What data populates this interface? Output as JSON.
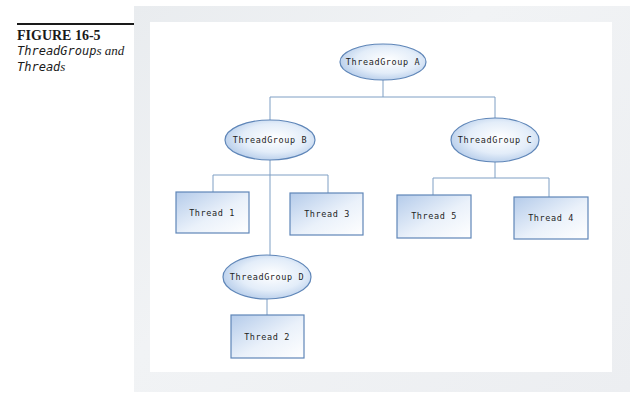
{
  "caption": {
    "figure_number": "FIGURE 16-5",
    "title_part1_code": "ThreadGroup",
    "title_part1_suffix": "s and",
    "title_part2_code": "Thread",
    "title_part2_suffix": "s"
  },
  "colors": {
    "line": "#7f9fc4",
    "node_border": "#5f86b8",
    "node_fill_light": "#ffffff",
    "node_fill_dark": "#b9d0ec",
    "frame_shadow": "#eceef1"
  },
  "diagram": {
    "groups": [
      {
        "id": "A",
        "label": "ThreadGroup A"
      },
      {
        "id": "B",
        "label": "ThreadGroup B"
      },
      {
        "id": "C",
        "label": "ThreadGroup C"
      },
      {
        "id": "D",
        "label": "ThreadGroup D"
      }
    ],
    "threads": [
      {
        "id": "1",
        "label": "Thread 1",
        "parent": "B"
      },
      {
        "id": "3",
        "label": "Thread 3",
        "parent": "B"
      },
      {
        "id": "5",
        "label": "Thread 5",
        "parent": "C"
      },
      {
        "id": "4",
        "label": "Thread 4",
        "parent": "C"
      },
      {
        "id": "2",
        "label": "Thread 2",
        "parent": "D"
      }
    ],
    "edges": [
      [
        "A",
        "B"
      ],
      [
        "A",
        "C"
      ],
      [
        "B",
        "Thread 1"
      ],
      [
        "B",
        "Thread 3"
      ],
      [
        "B",
        "D"
      ],
      [
        "C",
        "Thread 5"
      ],
      [
        "C",
        "Thread 4"
      ],
      [
        "D",
        "Thread 2"
      ]
    ]
  }
}
